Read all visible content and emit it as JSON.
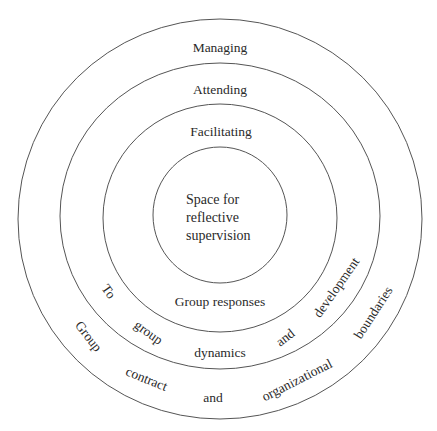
{
  "diagram": {
    "type": "concentric-circles",
    "rings": [
      {
        "name": "outer",
        "label": "Managing",
        "curved_labels": [
          "Group",
          "contract",
          "and",
          "organizational",
          "boundaries"
        ]
      },
      {
        "name": "second",
        "label": "Attending",
        "curved_labels": [
          "To",
          "group",
          "dynamics",
          "and",
          "development"
        ]
      },
      {
        "name": "third",
        "label": "Facilitating",
        "curved_labels": [
          "Group responses"
        ]
      },
      {
        "name": "core",
        "label_lines": [
          "Space for",
          "reflective",
          "supervision"
        ]
      }
    ],
    "labels": {
      "managing": "Managing",
      "attending": "Attending",
      "facilitating": "Facilitating",
      "core_line1": "Space for",
      "core_line2": "reflective",
      "core_line3": "supervision",
      "group_responses": "Group responses",
      "to": "To",
      "group_lower": "group",
      "dynamics": "dynamics",
      "and_inner": "and",
      "development": "development",
      "group_upper": "Group",
      "contract": "contract",
      "and_outer": "and",
      "organizational": "organizational",
      "boundaries": "boundaries"
    },
    "colors": {
      "stroke": "#555555",
      "text": "#2a2a2a",
      "background": "#ffffff"
    }
  }
}
